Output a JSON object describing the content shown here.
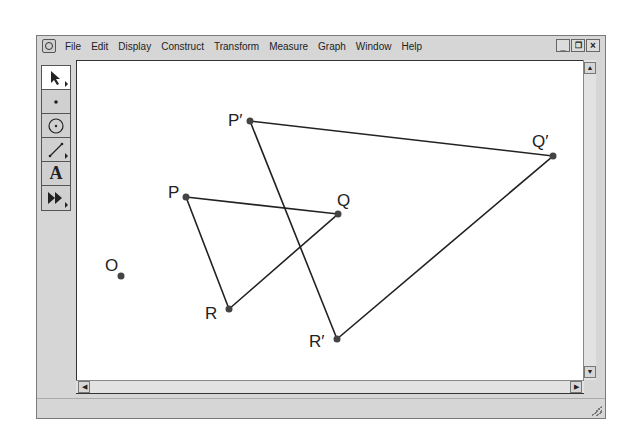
{
  "window": {
    "menu": [
      "File",
      "Edit",
      "Display",
      "Construct",
      "Transform",
      "Measure",
      "Graph",
      "Window",
      "Help"
    ],
    "controls": {
      "minimize": "_",
      "restore": "🗗",
      "close": "×"
    }
  },
  "toolbox": [
    {
      "name": "selection-arrow-tool",
      "glyph": "arrow"
    },
    {
      "name": "point-tool",
      "glyph": "dot"
    },
    {
      "name": "compass-tool",
      "glyph": "circle"
    },
    {
      "name": "straightedge-tool",
      "glyph": "segment"
    },
    {
      "name": "text-tool",
      "glyph": "A"
    },
    {
      "name": "custom-tool",
      "glyph": "▶▶"
    }
  ],
  "canvas": {
    "points": [
      {
        "label": "P′",
        "x": 248,
        "y": 120
      },
      {
        "label": "Q′",
        "x": 551,
        "y": 155
      },
      {
        "label": "R′",
        "x": 335,
        "y": 338
      },
      {
        "label": "P",
        "x": 184,
        "y": 196
      },
      {
        "label": "Q",
        "x": 336,
        "y": 213
      },
      {
        "label": "R",
        "x": 227,
        "y": 308
      },
      {
        "label": "O",
        "x": 119,
        "y": 275
      }
    ],
    "labels": {
      "P_prime": "P′",
      "Q_prime": "Q′",
      "R_prime": "R′",
      "P": "P",
      "Q": "Q",
      "R": "R",
      "O": "O"
    }
  },
  "scrollbars": {
    "up": "▲",
    "down": "▼",
    "left": "◀",
    "right": "▶"
  }
}
